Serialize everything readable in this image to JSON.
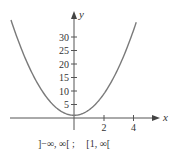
{
  "chart_data": {
    "type": "line",
    "title": "",
    "function": "y = 2x^2 + 1",
    "series": [
      {
        "name": "parabola",
        "x": [
          -4.2,
          -4,
          -3,
          -2,
          -1,
          0,
          1,
          2,
          3,
          4,
          4.15
        ],
        "y": [
          36.3,
          33,
          19,
          9,
          3,
          1,
          3,
          9,
          19,
          33,
          35.4
        ]
      }
    ],
    "xlabel": "x",
    "ylabel": "y",
    "x_ticks": [
      "2",
      "4"
    ],
    "y_ticks": [
      "5",
      "10",
      "15",
      "20",
      "25",
      "30"
    ],
    "xlim": [
      -4.3,
      5.6
    ],
    "ylim": [
      -7,
      39
    ],
    "grid": false,
    "legend": null,
    "annotations": [
      "]−∞, ∞[ ;",
      "[1, ∞["
    ]
  },
  "caption": {
    "domain": "]−∞, ∞[ ;",
    "range": "[1, ∞["
  },
  "colors": {
    "curve": "#7a7a7a",
    "axes": "#555555",
    "text": "#333333"
  }
}
